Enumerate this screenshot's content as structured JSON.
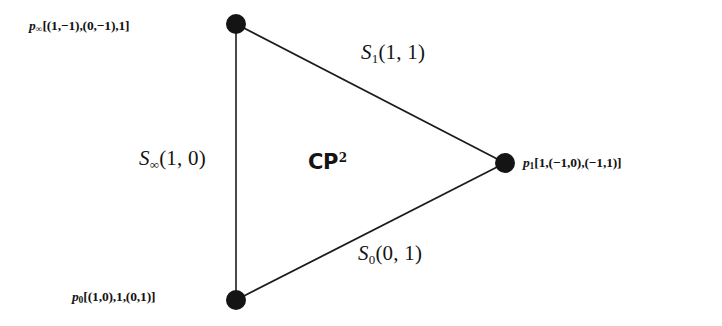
{
  "figure": {
    "kind": "moment-polytope-fan-diagram",
    "background_color": "#ffffff",
    "stroke_color": "#1c1c1c",
    "text_color": "#141414",
    "space_label": {
      "symbol": "CP",
      "exponent": "2",
      "full_text": "CP2"
    },
    "vertices": [
      {
        "id": "p-infinity",
        "name": "p",
        "subscript": "∞",
        "label_text": "[(1,−1),(0,−1),1]",
        "full_text": "p∞[(1,−1),(0,−1),1]",
        "x": 236,
        "y": 24,
        "radius": 10
      },
      {
        "id": "p-zero",
        "name": "p",
        "subscript": "0",
        "label_text": "[(1,0),1,(0,1)]",
        "full_text": "p0[(1,0),1,(0,1)]",
        "x": 236,
        "y": 300,
        "radius": 10
      },
      {
        "id": "p-one",
        "name": "p",
        "subscript": "1",
        "label_text": "[1,(−1,0),(−1,1)]",
        "full_text": "p1[1,(−1,0),(−1,1)]",
        "x": 505,
        "y": 163,
        "radius": 10
      }
    ],
    "edges": [
      {
        "id": "s-one",
        "name": "S",
        "subscript": "1",
        "weight_text": "(1, 1)",
        "full_text": "S1(1, 1)",
        "from": "p-infinity",
        "to": "p-one"
      },
      {
        "id": "s-infinity",
        "name": "S",
        "subscript": "∞",
        "weight_text": "(1, 0)",
        "full_text": "S∞(1, 0)",
        "from": "p-infinity",
        "to": "p-zero"
      },
      {
        "id": "s-zero",
        "name": "S",
        "subscript": "0",
        "weight_text": "(0, 1)",
        "full_text": "S0(0, 1)",
        "from": "p-zero",
        "to": "p-one"
      }
    ]
  }
}
